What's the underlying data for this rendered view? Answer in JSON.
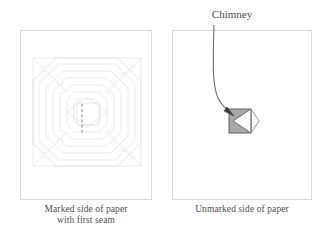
{
  "figure": {
    "background_color": "#ffffff",
    "panel_border_color": "#d9d9d9",
    "line_color": "#e2e2e2",
    "text_color": "#4e4e4e"
  },
  "panels": [
    {
      "id": "marked",
      "caption_line1": "Marked side of paper",
      "caption_line2": "with first seam",
      "pattern": {
        "type": "concentric-octagons",
        "ring_count": 7,
        "outer_square_color": "#e2e2e2",
        "seam": {
          "label": "first seam",
          "style": "dashed",
          "color": "#8a8a8a",
          "orientation": "vertical"
        }
      }
    },
    {
      "id": "unmarked",
      "caption_line1": "Unmarked side of paper",
      "caption_line2": "",
      "shape": {
        "name": "chimney",
        "fill_color": "#a8a8a8",
        "stroke_color": "#6e6e6e",
        "notch_fill": "#ffffff",
        "notch_direction": "left"
      }
    }
  ],
  "annotations": [
    {
      "id": "chimney-callout",
      "label": "Chimney",
      "arrow": {
        "style": "curved",
        "color": "#5a5a5a",
        "head": "solid-triangle",
        "points_to": "chimney"
      }
    }
  ]
}
